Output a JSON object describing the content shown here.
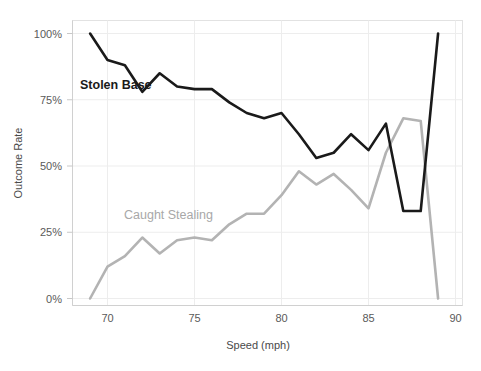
{
  "chart_data": {
    "type": "line",
    "title": "",
    "xlabel": "Speed (mph)",
    "ylabel": "Outcome Rate",
    "xlim": [
      68.6,
      90
    ],
    "ylim": [
      0,
      1.0
    ],
    "xticks": [
      70,
      75,
      80,
      85,
      90
    ],
    "xtick_labels": [
      "70",
      "75",
      "80",
      "85",
      "90"
    ],
    "yticks": [
      0,
      0.25,
      0.5,
      0.75,
      1.0
    ],
    "ytick_labels": [
      "0%",
      "25%",
      "50%",
      "75%",
      "100%"
    ],
    "grid": "vertical-only",
    "legend": "inline-annotations",
    "series": [
      {
        "name": "Stolen Base",
        "color": "#1a1a1a",
        "label_position": {
          "x": 80,
          "y": 89
        },
        "x": [
          69,
          70,
          71,
          72,
          73,
          74,
          75,
          76,
          77,
          78,
          79,
          80,
          81,
          82,
          83,
          84,
          85,
          86,
          87,
          88,
          89
        ],
        "values": [
          1.0,
          0.9,
          0.88,
          0.78,
          0.85,
          0.8,
          0.79,
          0.79,
          0.74,
          0.7,
          0.68,
          0.7,
          0.62,
          0.53,
          0.55,
          0.62,
          0.56,
          0.66,
          0.33,
          0.33,
          1.0
        ]
      },
      {
        "name": "Caught Stealing",
        "color": "#b3b3b3",
        "label_position": {
          "x": 124,
          "y": 219
        },
        "x": [
          69,
          70,
          71,
          72,
          73,
          74,
          75,
          76,
          77,
          78,
          79,
          80,
          81,
          82,
          83,
          84,
          85,
          86,
          87,
          88,
          89
        ],
        "values": [
          0.0,
          0.12,
          0.16,
          0.23,
          0.17,
          0.22,
          0.23,
          0.22,
          0.28,
          0.32,
          0.32,
          0.39,
          0.48,
          0.43,
          0.47,
          0.41,
          0.34,
          0.55,
          0.68,
          0.67,
          0.0
        ]
      }
    ]
  },
  "axis": {
    "x_title": "Speed (mph)",
    "y_title": "Outcome Rate",
    "x_ticks": [
      "70",
      "75",
      "80",
      "85",
      "90"
    ],
    "y_ticks": [
      "100%",
      "75%",
      "50%",
      "25%",
      "0%"
    ]
  },
  "annotations": {
    "stolen_base": "Stolen Base",
    "caught_stealing": "Caught Stealing"
  },
  "colors": {
    "stolen_base": "#1a1a1a",
    "caught_stealing": "#b3b3b3",
    "grid": "#ededed",
    "border": "#e2e2e2",
    "tick_text": "#5a5a5a",
    "background": "#ffffff"
  }
}
